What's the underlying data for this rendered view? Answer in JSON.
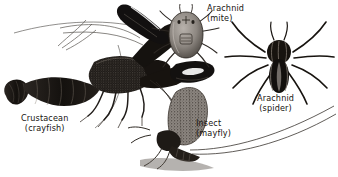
{
  "plate": {
    "title": "Arthropod groups illustration plate",
    "background_color": "#ffffff",
    "ink_color": "#16120f",
    "width": 338,
    "height": 177,
    "style": "black-and-white engraving / scratchboard line art"
  },
  "labels": [
    {
      "id": "crayfish",
      "group": "Crustacean",
      "example": "(crayfish)",
      "x": 21,
      "y": 114
    },
    {
      "id": "mite",
      "group": "Arachnid",
      "example": "(mite)",
      "x": 207,
      "y": 4
    },
    {
      "id": "spider",
      "group": "Arachnid",
      "example": "(spider)",
      "x": 257,
      "y": 94
    },
    {
      "id": "mayfly",
      "group": "Insect",
      "example": "(mayfly)",
      "x": 196,
      "y": 119
    }
  ],
  "figures": [
    {
      "id": "crayfish",
      "name": "crayfish",
      "description": "Large crustacean with two pincer claws, segmented tail with fan, long antennae",
      "tone": "dark ink stipple"
    },
    {
      "id": "mite",
      "name": "mite",
      "description": "Small oval-bodied arachnid, grey shaded abdomen, eight short legs",
      "tone": "mid grey"
    },
    {
      "id": "spider",
      "name": "spider",
      "description": "Dark arachnid with eight long legs and striped abdomen",
      "tone": "near black"
    },
    {
      "id": "mayfly",
      "name": "mayfly",
      "description": "Insect with large upright mottled triangular wing and long trailing cerci",
      "tone": "speckled grey"
    }
  ]
}
